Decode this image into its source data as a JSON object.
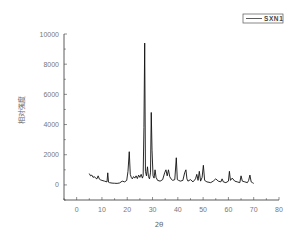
{
  "chart_data": {
    "type": "line",
    "title": "",
    "xlabel": "2θ",
    "ylabel": "相对强度",
    "xlim": [
      -5,
      80
    ],
    "ylim": [
      -1000,
      10000
    ],
    "xticks": [
      0,
      10,
      20,
      30,
      40,
      50,
      60,
      70,
      80
    ],
    "yticks": [
      0,
      2000,
      4000,
      6000,
      8000,
      10000
    ],
    "xtick_labels": [
      "0",
      "10",
      "20",
      "30",
      "40",
      "50",
      "60",
      "70",
      "80"
    ],
    "ytick_labels": [
      "0",
      "2000",
      "4000",
      "6000",
      "8000",
      "10000"
    ],
    "grid": false,
    "legend_position": "top-right",
    "series": [
      {
        "name": "SXN1",
        "color": "#111111",
        "x": [
          5,
          5.5,
          6,
          6.5,
          7,
          7.5,
          8,
          8.5,
          9,
          9.5,
          10,
          11,
          12,
          12.3,
          12.6,
          13,
          14,
          15,
          16,
          17,
          18,
          19,
          19.8,
          20.3,
          20.8,
          21.2,
          21.6,
          22,
          22.5,
          23,
          23.5,
          24,
          24.5,
          25,
          25.5,
          26,
          26.3,
          26.6,
          26.9,
          27.2,
          27.6,
          28,
          28.4,
          28.8,
          29.2,
          29.5,
          29.8,
          30.2,
          30.6,
          31,
          31.4,
          32,
          33,
          34,
          34.8,
          35.3,
          35.8,
          36.3,
          36.8,
          37.3,
          38,
          38.8,
          39.4,
          39.8,
          40.3,
          41,
          42,
          42.7,
          43.2,
          43.6,
          44,
          45,
          46,
          47,
          47.5,
          48,
          48.5,
          49,
          49.6,
          50.1,
          50.6,
          51.5,
          53,
          54,
          55,
          56,
          57,
          57.5,
          58,
          59,
          60,
          60.4,
          60.8,
          61.5,
          62.5,
          63.5,
          64.5,
          65,
          65.5,
          66.5,
          67.5,
          68,
          68.5,
          69,
          69.5,
          70
        ],
        "y": [
          750,
          600,
          650,
          500,
          550,
          450,
          400,
          600,
          380,
          330,
          300,
          250,
          200,
          800,
          180,
          150,
          120,
          110,
          100,
          130,
          250,
          200,
          300,
          900,
          2200,
          700,
          500,
          400,
          550,
          450,
          600,
          420,
          650,
          500,
          700,
          450,
          600,
          3800,
          9400,
          900,
          600,
          1200,
          550,
          400,
          800,
          4800,
          2300,
          600,
          450,
          1000,
          500,
          300,
          250,
          350,
          800,
          1000,
          600,
          1000,
          550,
          400,
          300,
          350,
          1800,
          350,
          300,
          250,
          300,
          800,
          1000,
          400,
          250,
          350,
          200,
          400,
          700,
          300,
          900,
          250,
          500,
          1300,
          300,
          200,
          150,
          250,
          400,
          250,
          200,
          400,
          200,
          150,
          250,
          900,
          300,
          450,
          250,
          200,
          150,
          600,
          250,
          200,
          150,
          300,
          650,
          200,
          150,
          100
        ]
      }
    ]
  },
  "legend": {
    "label": "SXN1"
  }
}
